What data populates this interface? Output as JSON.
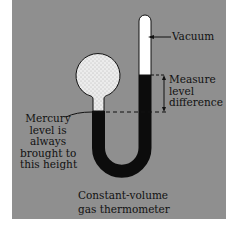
{
  "diagram": {
    "title": "Constant-volume gas thermometer",
    "caption": {
      "line1": "Constant-volume",
      "line2": "gas thermometer"
    },
    "labels": {
      "vacuum": "Vacuum",
      "measure": {
        "line1": "Measure",
        "line2": "level",
        "line3": "difference"
      },
      "mercury": {
        "line1": "Mercury",
        "line2": "level is",
        "line3": "always",
        "line4": "brought to",
        "line5": "this height"
      }
    },
    "colors": {
      "background": "#8f8f8f",
      "mercury": "#0c0c0c",
      "vacuum": "#ffffff",
      "gas_bulb": "#e8e8e8"
    }
  }
}
